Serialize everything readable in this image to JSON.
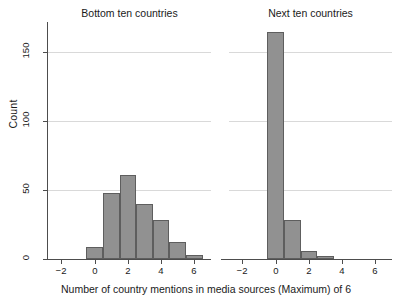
{
  "chart_data": {
    "type": "bar",
    "title": "",
    "xlabel": "Number of country mentions in media sources (Maximum) of 6",
    "ylabel": "Count",
    "xlim": [
      -2.8,
      7.0
    ],
    "ylim": [
      0,
      172
    ],
    "xticks": [
      "-2",
      "0",
      "2",
      "4",
      "6"
    ],
    "xtick_values": [
      -2,
      0,
      2,
      4,
      6
    ],
    "yticks": [
      "0",
      "50",
      "100",
      "150"
    ],
    "ytick_values": [
      0,
      50,
      100,
      150
    ],
    "grid": "horizontal",
    "legend": "none",
    "bar_color": "#919191",
    "bar_edge_color": "#5e5e5e",
    "grid_color": "#d9d9d9",
    "axis_color": "#4d4d4d",
    "panels": [
      {
        "title": "Bottom ten countries",
        "categories": [
          0,
          1,
          2,
          3,
          4,
          5,
          6
        ],
        "values": [
          9,
          48,
          61,
          40,
          28,
          12,
          3
        ]
      },
      {
        "title": "Next ten countries",
        "categories": [
          0,
          1,
          2,
          3
        ],
        "values": [
          165,
          28,
          6,
          2
        ]
      }
    ]
  }
}
